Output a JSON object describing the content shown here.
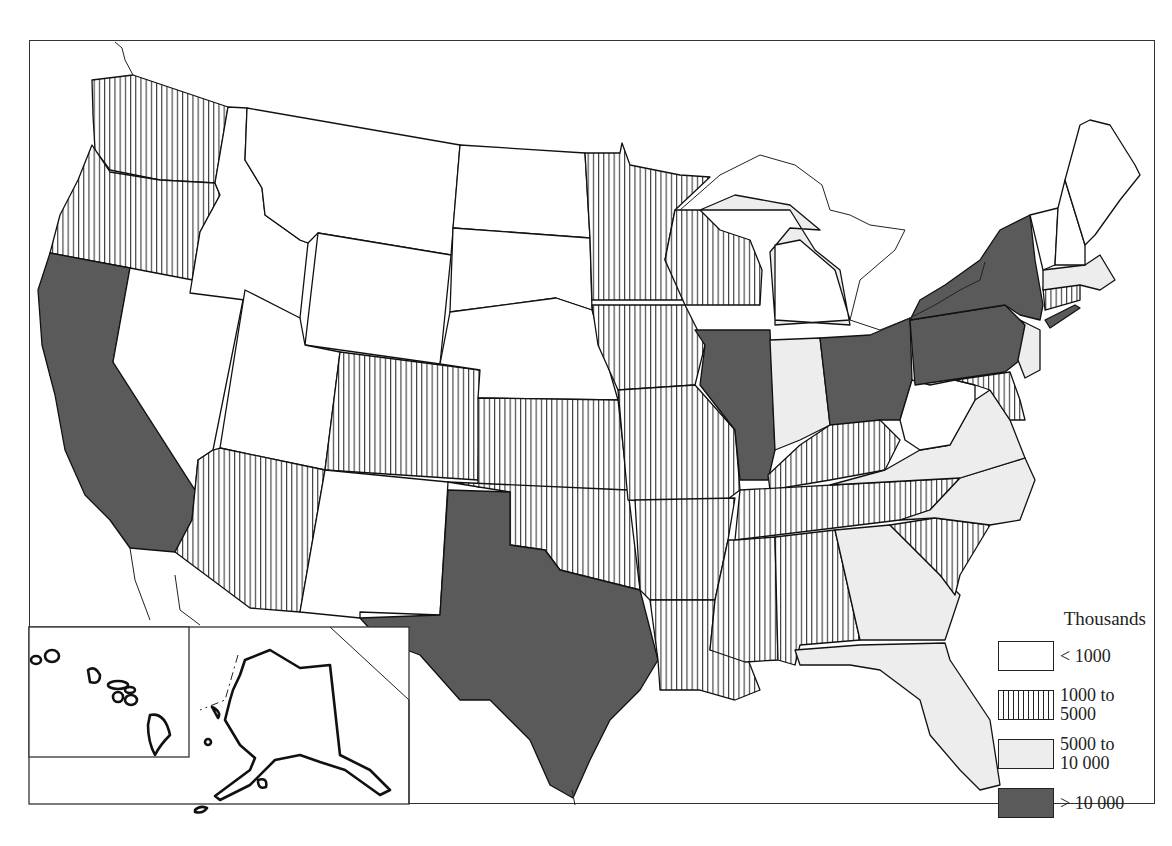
{
  "map": {
    "subject": "United States population by state",
    "frame": true
  },
  "legend": {
    "title": "Thousands",
    "classes": [
      {
        "id": "low",
        "label": "< 1000",
        "pattern": "blank",
        "color": "#ffffff"
      },
      {
        "id": "mid",
        "label": "1000 to\n5000",
        "pattern": "vertical-hatch",
        "color": "#222222"
      },
      {
        "id": "high",
        "label": "5000 to\n10 000",
        "pattern": "light-stipple",
        "color": "#ededed"
      },
      {
        "id": "top",
        "label": "> 10 000",
        "pattern": "dark-stipple",
        "color": "#5a5a5a"
      }
    ]
  },
  "states": {
    "low": [
      "Idaho",
      "Montana",
      "Wyoming",
      "North Dakota",
      "South Dakota",
      "Nebraska",
      "Nevada",
      "Utah",
      "New Mexico",
      "West Virginia",
      "Vermont",
      "New Hampshire",
      "Maine",
      "Alaska",
      "Hawaii"
    ],
    "mid": [
      "Washington",
      "Oregon",
      "Arizona",
      "Colorado",
      "Kansas",
      "Oklahoma",
      "Minnesota",
      "Iowa",
      "Missouri",
      "Arkansas",
      "Louisiana",
      "Wisconsin",
      "Kentucky",
      "Tennessee",
      "Mississippi",
      "Alabama",
      "South Carolina",
      "Maryland",
      "Connecticut"
    ],
    "high": [
      "Michigan",
      "Indiana",
      "Virginia",
      "North Carolina",
      "Georgia",
      "Florida",
      "New Jersey",
      "Massachusetts"
    ],
    "top": [
      "California",
      "Texas",
      "Illinois",
      "Ohio",
      "Pennsylvania",
      "New York"
    ]
  },
  "insets": [
    {
      "name": "Hawaii",
      "class": "low"
    },
    {
      "name": "Alaska",
      "class": "low"
    }
  ]
}
